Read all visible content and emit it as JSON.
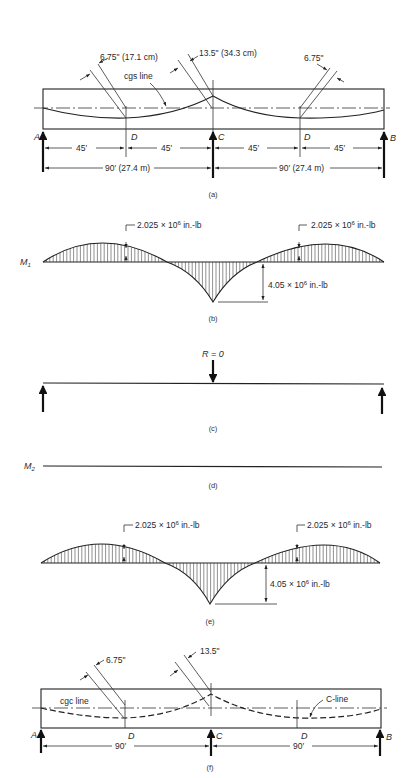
{
  "panels": {
    "a": {
      "caption": "(a)",
      "ecc_d_left": "6.75\" (17.1 cm)",
      "ecc_c": "13.5\" (34.3 cm)",
      "ecc_d_right": "6.75\"",
      "line_label": "cgs line",
      "support_a": "A",
      "support_c": "C",
      "support_b": "B",
      "point_d_left": "D",
      "point_d_right": "D",
      "dim_half_1": "45′",
      "dim_half_2": "45′",
      "dim_half_3": "45′",
      "dim_half_4": "45′",
      "span_left": "90′ (27.4 m)",
      "span_right": "90′ (27.4 m)"
    },
    "b": {
      "caption": "(b)",
      "moment_label": "M",
      "moment_sub": "1",
      "pos_moment_left": "2.025 × 10",
      "pos_moment_left_exp": "6",
      "pos_moment_left_unit": " in.-lb",
      "pos_moment_right": "2.025 × 10",
      "pos_moment_right_exp": "6",
      "pos_moment_right_unit": " in.-lb",
      "neg_moment": "4.05 × 10",
      "neg_moment_exp": "6",
      "neg_moment_unit": " in.-lb"
    },
    "c": {
      "caption": "(c)",
      "reaction_label": "R = 0"
    },
    "d": {
      "caption": "(d)",
      "moment_label": "M",
      "moment_sub": "2"
    },
    "e": {
      "caption": "(e)",
      "pos_moment_left": "2.025 × 10",
      "pos_moment_left_exp": "6",
      "pos_moment_left_unit": " in.-lb",
      "pos_moment_right": "2.025 × 10",
      "pos_moment_right_exp": "6",
      "pos_moment_right_unit": " in.-lb",
      "neg_moment": "4.05 × 10",
      "neg_moment_exp": "6",
      "neg_moment_unit": " in.-lb"
    },
    "f": {
      "caption": "(f)",
      "ecc_d": "6.75\"",
      "ecc_c": "13.5\"",
      "cgc_label": "cgc line",
      "c_line_label": "C-line",
      "support_a": "A",
      "support_c": "C",
      "support_b": "B",
      "point_d_left": "D",
      "point_d_right": "D",
      "span_left": "90′",
      "span_right": "90′"
    }
  }
}
